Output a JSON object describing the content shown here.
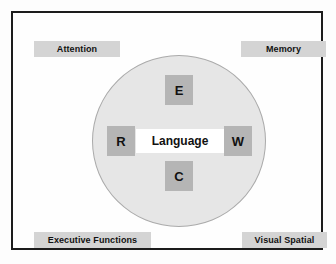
{
  "figure": {
    "background_color": "#fdfdfd",
    "frame_color": "#1c1c1c"
  },
  "circle": {
    "name": "language-domain-circle",
    "fill_color": "#e6e6e6",
    "stroke_color": "#aaaaaa"
  },
  "corner_labels": [
    {
      "id": "attention",
      "label": "Attention",
      "position": "top-left",
      "background_color": "#d4d4d4",
      "text_color": "#111111"
    },
    {
      "id": "memory",
      "label": "Memory",
      "position": "top-right",
      "background_color": "#d4d4d4",
      "text_color": "#111111"
    },
    {
      "id": "executive",
      "label": "Executive Functions",
      "position": "bottom-left",
      "background_color": "#d4d4d4",
      "text_color": "#111111"
    },
    {
      "id": "visual_spatial",
      "label": "Visual Spatial",
      "position": "bottom-right",
      "background_color": "#d4d4d4",
      "text_color": "#111111"
    }
  ],
  "center": {
    "label": "Language",
    "background_color": "#ffffff",
    "text_color": "#111111"
  },
  "letter_tiles": [
    {
      "id": "e",
      "label": "E",
      "position": "top",
      "background_color": "#b5b5b5",
      "text_color": "#111111"
    },
    {
      "id": "r",
      "label": "R",
      "position": "left",
      "background_color": "#b5b5b5",
      "text_color": "#111111"
    },
    {
      "id": "w",
      "label": "W",
      "position": "right",
      "background_color": "#b5b5b5",
      "text_color": "#111111"
    },
    {
      "id": "c",
      "label": "C",
      "position": "bottom",
      "background_color": "#b5b5b5",
      "text_color": "#111111"
    }
  ]
}
